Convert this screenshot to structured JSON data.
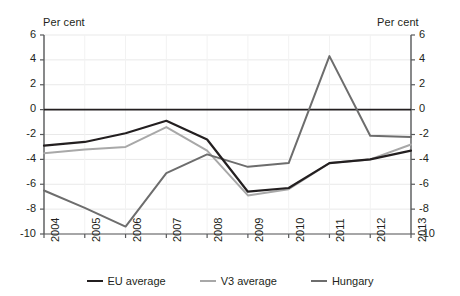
{
  "chart_data": {
    "type": "line",
    "title": "",
    "subtitle": "",
    "xlabel": "",
    "ylabel": "Per cent",
    "ylabel_right": "Per cent",
    "ylim": [
      -10,
      6
    ],
    "yticks": [
      6,
      4,
      2,
      0,
      -2,
      -4,
      -6,
      -8,
      -10
    ],
    "ytick_labels": [
      "6",
      "4",
      "2",
      "0",
      "-2",
      "-4",
      "-6",
      "-8",
      "-10"
    ],
    "grid": true,
    "grid_axis": "y",
    "legend_position": "bottom",
    "categories": [
      "2004",
      "2005",
      "2006",
      "2007",
      "2008",
      "2009",
      "2010",
      "2011",
      "2012",
      "2013"
    ],
    "x": [
      2004,
      2005,
      2006,
      2007,
      2008,
      2009,
      2010,
      2011,
      2012,
      2013
    ],
    "series": [
      {
        "name": "EU average",
        "color": "#231f20",
        "width": 2.2,
        "values": [
          -2.9,
          -2.6,
          -1.9,
          -0.9,
          -2.4,
          -6.6,
          -6.3,
          -4.3,
          -4.0,
          -3.3
        ]
      },
      {
        "name": "V3 average",
        "color": "#a8a8a8",
        "width": 2.0,
        "values": [
          -3.5,
          -3.2,
          -3.0,
          -1.4,
          -3.3,
          -6.9,
          -6.4,
          -4.3,
          -4.0,
          -2.8
        ]
      },
      {
        "name": "Hungary",
        "color": "#6d6d6d",
        "width": 2.0,
        "values": [
          -6.5,
          -7.9,
          -9.4,
          -5.1,
          -3.6,
          -4.6,
          -4.3,
          4.3,
          -2.1,
          -2.2
        ]
      }
    ]
  },
  "legend": {
    "items": [
      {
        "label": "EU average",
        "color": "#231f20"
      },
      {
        "label": "V3 average",
        "color": "#a8a8a8"
      },
      {
        "label": "Hungary",
        "color": "#6d6d6d"
      }
    ]
  }
}
